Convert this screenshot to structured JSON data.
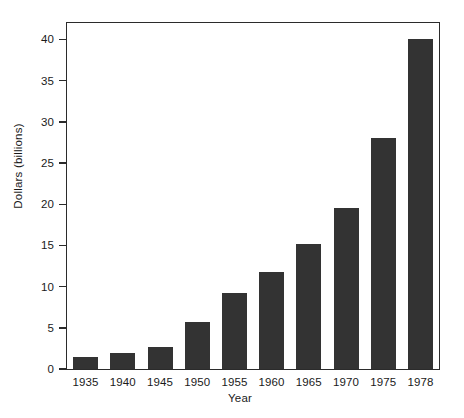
{
  "chart_data": {
    "type": "bar",
    "title": "",
    "subtitle": "",
    "xlabel": "Year",
    "ylabel": "Dollars (billions)",
    "categories": [
      "1935",
      "1940",
      "1945",
      "1950",
      "1955",
      "1960",
      "1965",
      "1970",
      "1975",
      "1978"
    ],
    "values": [
      1.4,
      2.0,
      2.7,
      5.7,
      9.2,
      11.8,
      15.2,
      19.5,
      28.0,
      40.0
    ],
    "ylim": [
      0,
      42
    ],
    "yticks": [
      0,
      5,
      10,
      15,
      20,
      25,
      30,
      35,
      40
    ],
    "ytick_labels": [
      "0",
      "5",
      "10",
      "15",
      "20",
      "25",
      "30",
      "35",
      "40"
    ],
    "grid": false,
    "legend": null,
    "legend_position": "none",
    "bar_color": "#333333",
    "frame_color": "#2b2b2b",
    "background": "#ffffff"
  }
}
